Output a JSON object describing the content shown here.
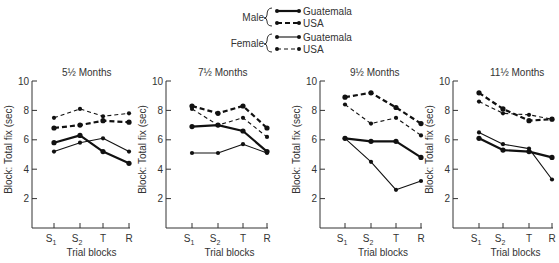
{
  "legend": {
    "groups": [
      {
        "label": "Male",
        "entries": [
          {
            "label": "Guatemala",
            "series": "male_guatemala"
          },
          {
            "label": "USA",
            "series": "male_usa"
          }
        ]
      },
      {
        "label": "Female",
        "entries": [
          {
            "label": "Guatemala",
            "series": "female_guatemala"
          },
          {
            "label": "USA",
            "series": "female_usa"
          }
        ]
      }
    ]
  },
  "chart_data": [
    {
      "type": "line",
      "title": "5½ Months",
      "xlabel": "Trial blocks",
      "ylabel": "Block: Total fix (sec)",
      "categories": [
        "S1",
        "S2",
        "T",
        "R"
      ],
      "yticks": [
        2,
        4,
        6,
        8,
        10
      ],
      "ylim": [
        0,
        10
      ],
      "grid": false,
      "series": [
        {
          "name": "Male Guatemala",
          "key": "male_guatemala",
          "values": [
            5.8,
            6.3,
            5.2,
            4.4
          ]
        },
        {
          "name": "Male USA",
          "key": "male_usa",
          "values": [
            6.8,
            7.0,
            7.3,
            7.2
          ]
        },
        {
          "name": "Female Guatemala",
          "key": "female_guatemala",
          "values": [
            5.2,
            5.8,
            6.1,
            5.2
          ]
        },
        {
          "name": "Female USA",
          "key": "female_usa",
          "values": [
            7.5,
            8.1,
            7.6,
            7.8
          ]
        }
      ]
    },
    {
      "type": "line",
      "title": "7½ Months",
      "xlabel": "Trial blocks",
      "ylabel": "Block: Total fix (sec)",
      "categories": [
        "S1",
        "S2",
        "T",
        "R"
      ],
      "yticks": [
        2,
        4,
        6,
        8,
        10
      ],
      "ylim": [
        0,
        10
      ],
      "grid": false,
      "series": [
        {
          "name": "Male Guatemala",
          "key": "male_guatemala",
          "values": [
            6.9,
            7.0,
            6.6,
            5.2
          ]
        },
        {
          "name": "Male USA",
          "key": "male_usa",
          "values": [
            8.3,
            7.8,
            8.3,
            6.8
          ]
        },
        {
          "name": "Female Guatemala",
          "key": "female_guatemala",
          "values": [
            5.1,
            5.1,
            5.7,
            5.1
          ]
        },
        {
          "name": "Female USA",
          "key": "female_usa",
          "values": [
            8.1,
            7.0,
            7.5,
            6.2
          ]
        }
      ]
    },
    {
      "type": "line",
      "title": "9½ Months",
      "xlabel": "Trial blocks",
      "ylabel": "Block: Total fix (sec)",
      "categories": [
        "S1",
        "S2",
        "T",
        "R"
      ],
      "yticks": [
        2,
        4,
        6,
        8,
        10
      ],
      "ylim": [
        0,
        10
      ],
      "grid": false,
      "series": [
        {
          "name": "Male Guatemala",
          "key": "male_guatemala",
          "values": [
            6.1,
            5.9,
            5.9,
            4.8
          ]
        },
        {
          "name": "Male USA",
          "key": "male_usa",
          "values": [
            8.9,
            9.2,
            8.2,
            7.1
          ]
        },
        {
          "name": "Female Guatemala",
          "key": "female_guatemala",
          "values": [
            6.1,
            4.5,
            2.6,
            3.2
          ]
        },
        {
          "name": "Female USA",
          "key": "female_usa",
          "values": [
            8.4,
            7.1,
            7.5,
            6.3
          ]
        }
      ]
    },
    {
      "type": "line",
      "title": "11½ Months",
      "xlabel": "Trial blocks",
      "ylabel": "Block: Total fix (sec)",
      "categories": [
        "S1",
        "S2",
        "T",
        "R"
      ],
      "yticks": [
        2,
        4,
        6,
        8,
        10
      ],
      "ylim": [
        0,
        10
      ],
      "grid": false,
      "series": [
        {
          "name": "Male Guatemala",
          "key": "male_guatemala",
          "values": [
            6.1,
            5.3,
            5.2,
            4.8
          ]
        },
        {
          "name": "Male USA",
          "key": "male_usa",
          "values": [
            9.2,
            8.1,
            7.3,
            7.4
          ]
        },
        {
          "name": "Female Guatemala",
          "key": "female_guatemala",
          "values": [
            6.5,
            5.7,
            5.4,
            3.3
          ]
        },
        {
          "name": "Female USA",
          "key": "female_usa",
          "values": [
            8.6,
            7.8,
            7.7,
            7.4
          ]
        }
      ]
    }
  ]
}
